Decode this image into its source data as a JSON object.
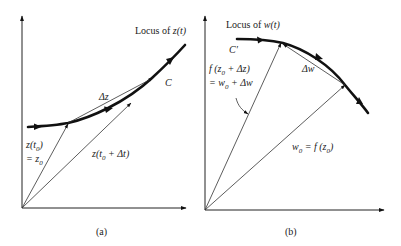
{
  "figure": {
    "panel_a": {
      "caption": "(a)",
      "locus_label": "Locus of z(t)",
      "locus_prefix": "Locus of ",
      "locus_var": "z(t)",
      "curve_label": "C",
      "delta_label": "Δz",
      "vector_start_line1": "z(t",
      "vector_start_sub": "0",
      "vector_start_close": ")",
      "vector_start_line2_eq": "= z",
      "vector_start_line2_sub": "0",
      "vector_end_prefix": "z(t",
      "vector_end_sub": "0",
      "vector_end_suffix": " + Δt)"
    },
    "panel_b": {
      "caption": "(b)",
      "locus_label": "Locus of w(t)",
      "locus_prefix": "Locus of ",
      "locus_var": "w(t)",
      "curve_label": "C′",
      "delta_label": "Δw",
      "vector_end_line1_prefix": "f (z",
      "vector_end_line1_sub": "0",
      "vector_end_line1_suffix": " + Δz)",
      "vector_end_line2_prefix": "= w",
      "vector_end_line2_sub": "0",
      "vector_end_line2_suffix": " + Δw",
      "vector_start_prefix": "w",
      "vector_start_sub": "0",
      "vector_start_mid": " = f (z",
      "vector_start_sub2": "0",
      "vector_start_close": ")"
    }
  }
}
